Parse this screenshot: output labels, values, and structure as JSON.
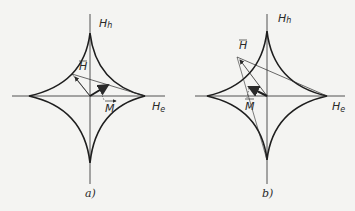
{
  "figure": {
    "panels": [
      {
        "id": "a",
        "caption": "a)",
        "axes": {
          "vertical_label_main": "H",
          "vertical_label_sub": "h",
          "horizontal_label_main": "H",
          "horizontal_label_sub": "e"
        },
        "vectors": {
          "field_label": "H",
          "magnetization_label": "M"
        }
      },
      {
        "id": "b",
        "caption": "b)",
        "axes": {
          "vertical_label_main": "H",
          "vertical_label_sub": "h",
          "horizontal_label_main": "H",
          "horizontal_label_sub": "e"
        },
        "vectors": {
          "field_label": "H",
          "magnetization_label": "M"
        }
      }
    ],
    "colors": {
      "ink": "#2a2a2a",
      "background": "#f4f4f2"
    }
  }
}
